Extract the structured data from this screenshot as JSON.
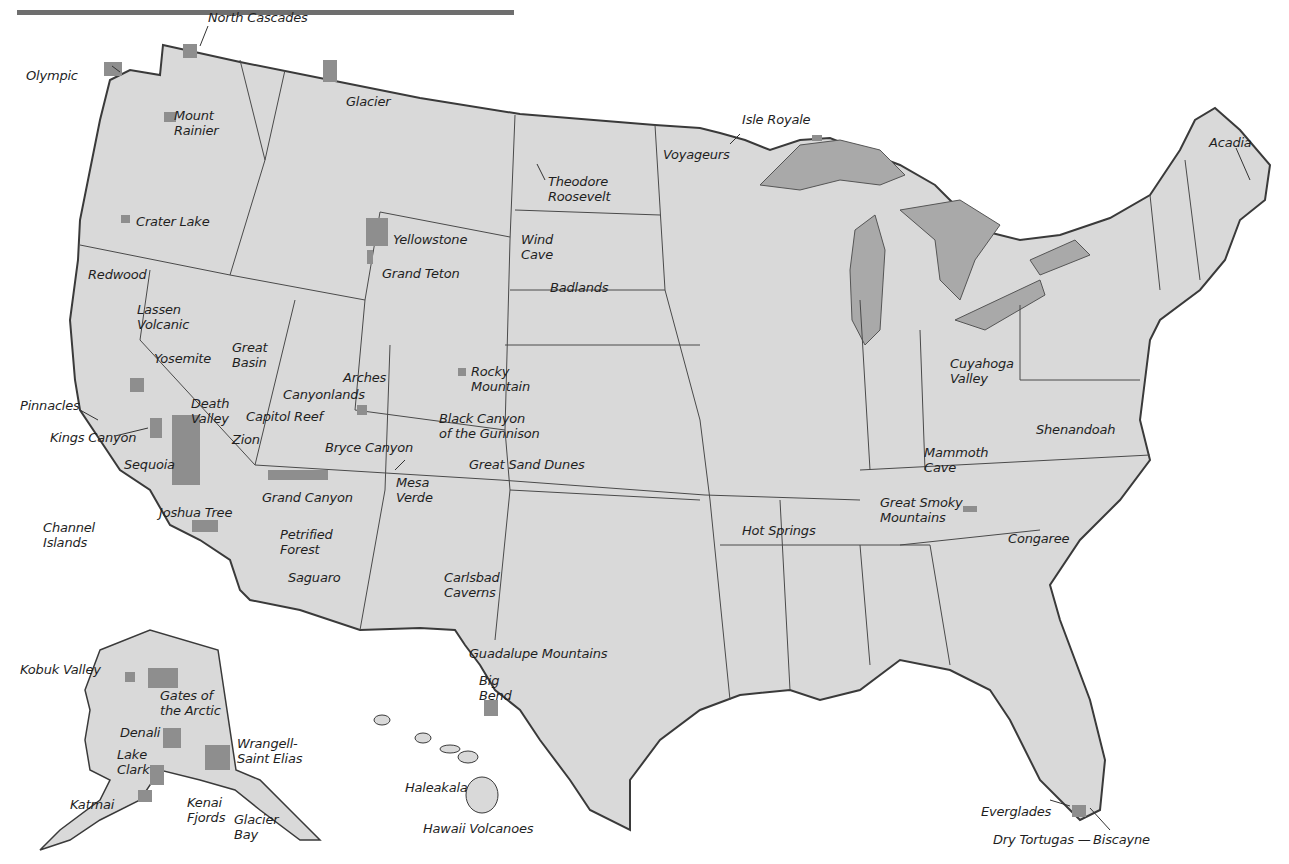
{
  "map": {
    "title_bar_color": "#6e6e6e",
    "colors": {
      "land": "#d9d9d9",
      "park": "#8e8e8e",
      "water_lakes": "#a9a9a9",
      "border": "#3a3a3a",
      "background": "#ffffff",
      "label_text": "#1f1f1f"
    },
    "regions": [
      "Contiguous United States",
      "Alaska",
      "Hawaii"
    ],
    "parks": [
      {
        "name": "North Cascades",
        "x": 208,
        "y": 10
      },
      {
        "name": "Olympic",
        "x": 26,
        "y": 68
      },
      {
        "name": "Glacier",
        "x": 346,
        "y": 94
      },
      {
        "name": "Mount\nRainier",
        "x": 174,
        "y": 108
      },
      {
        "name": "Crater Lake",
        "x": 136,
        "y": 214
      },
      {
        "name": "Redwood",
        "x": 88,
        "y": 267
      },
      {
        "name": "Lassen\nVolcanic",
        "x": 137,
        "y": 302
      },
      {
        "name": "Yellowstone",
        "x": 393,
        "y": 232
      },
      {
        "name": "Grand Teton",
        "x": 382,
        "y": 266
      },
      {
        "name": "Isle Royale",
        "x": 742,
        "y": 112
      },
      {
        "name": "Voyageurs",
        "x": 663,
        "y": 147
      },
      {
        "name": "Theodore\nRoosevelt",
        "x": 548,
        "y": 174
      },
      {
        "name": "Acadia",
        "x": 1209,
        "y": 135
      },
      {
        "name": "Wind\nCave",
        "x": 521,
        "y": 232
      },
      {
        "name": "Badlands",
        "x": 550,
        "y": 280
      },
      {
        "name": "Great\nBasin",
        "x": 232,
        "y": 340
      },
      {
        "name": "Yosemite",
        "x": 154,
        "y": 351
      },
      {
        "name": "Arches",
        "x": 343,
        "y": 370
      },
      {
        "name": "Canyonlands",
        "x": 283,
        "y": 387
      },
      {
        "name": "Rocky\nMountain",
        "x": 471,
        "y": 364
      },
      {
        "name": "Pinnacles",
        "x": 20,
        "y": 398
      },
      {
        "name": "Death\nValley",
        "x": 191,
        "y": 396
      },
      {
        "name": "Capitol Reef",
        "x": 246,
        "y": 409
      },
      {
        "name": "Black Canyon\nof the Gunnison",
        "x": 439,
        "y": 411
      },
      {
        "name": "Kings Canyon",
        "x": 50,
        "y": 430
      },
      {
        "name": "Zion",
        "x": 232,
        "y": 432
      },
      {
        "name": "Bryce Canyon",
        "x": 325,
        "y": 440
      },
      {
        "name": "Sequoia",
        "x": 124,
        "y": 457
      },
      {
        "name": "Great Sand Dunes",
        "x": 469,
        "y": 457
      },
      {
        "name": "Grand Canyon",
        "x": 262,
        "y": 490
      },
      {
        "name": "Mesa\nVerde",
        "x": 396,
        "y": 475
      },
      {
        "name": "Channel\nIslands",
        "x": 43,
        "y": 520
      },
      {
        "name": "Joshua Tree",
        "x": 159,
        "y": 505
      },
      {
        "name": "Petrified\nForest",
        "x": 280,
        "y": 527
      },
      {
        "name": "Saguaro",
        "x": 288,
        "y": 570
      },
      {
        "name": "Cuyahoga\nValley",
        "x": 950,
        "y": 356
      },
      {
        "name": "Shenandoah",
        "x": 1036,
        "y": 422
      },
      {
        "name": "Mammoth\nCave",
        "x": 924,
        "y": 445
      },
      {
        "name": "Great Smoky\nMountains",
        "x": 880,
        "y": 495
      },
      {
        "name": "Hot Springs",
        "x": 742,
        "y": 523
      },
      {
        "name": "Congaree",
        "x": 1008,
        "y": 531
      },
      {
        "name": "Carlsbad\nCaverns",
        "x": 444,
        "y": 570
      },
      {
        "name": "Guadalupe Mountains",
        "x": 469,
        "y": 646
      },
      {
        "name": "Big\nBend",
        "x": 479,
        "y": 673
      },
      {
        "name": "Kobuk Valley",
        "x": 20,
        "y": 662
      },
      {
        "name": "Gates of\nthe Arctic",
        "x": 160,
        "y": 688
      },
      {
        "name": "Denali",
        "x": 120,
        "y": 725
      },
      {
        "name": "Wrangell-\nSaint Elias",
        "x": 237,
        "y": 736
      },
      {
        "name": "Lake\nClark",
        "x": 117,
        "y": 747
      },
      {
        "name": "Katmai",
        "x": 70,
        "y": 797
      },
      {
        "name": "Kenai\nFjords",
        "x": 187,
        "y": 795
      },
      {
        "name": "Glacier\nBay",
        "x": 234,
        "y": 812
      },
      {
        "name": "Haleakala",
        "x": 405,
        "y": 780
      },
      {
        "name": "Hawaii Volcanoes",
        "x": 423,
        "y": 821
      },
      {
        "name": "Everglades",
        "x": 981,
        "y": 804
      },
      {
        "name": "Dry Tortugas —",
        "x": 993,
        "y": 832
      },
      {
        "name": "Biscayne",
        "x": 1093,
        "y": 832
      }
    ]
  }
}
